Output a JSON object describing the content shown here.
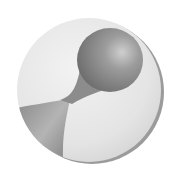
{
  "image": {
    "description": "Grayscale 3D disc emblem with dumbbell/hourglass shape",
    "colors": {
      "background": "#ffffff",
      "disc_light": "#ececec",
      "disc_mid": "#d6d6d6",
      "shape_dark": "#6e6e6e",
      "shape_mid": "#9a9a9a",
      "highlight": "#c8c8c8",
      "rim_shadow": "#8a8a8a"
    }
  }
}
